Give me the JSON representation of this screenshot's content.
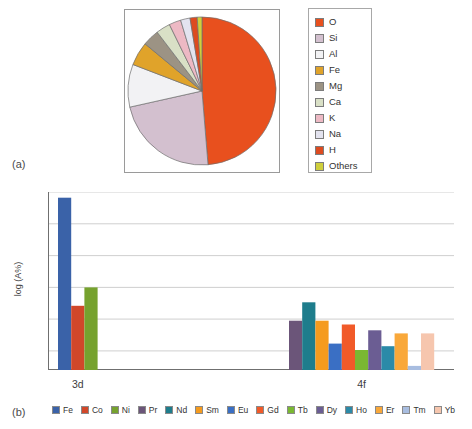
{
  "panels": {
    "a_label": "(a)",
    "b_label": "(b)"
  },
  "chart_data": [
    {
      "type": "pie",
      "title": "",
      "panel": "(a)",
      "legend_position": "right",
      "categories": [
        "O",
        "Si",
        "Al",
        "Fe",
        "Mg",
        "Ca",
        "K",
        "Na",
        "H",
        "Others"
      ],
      "values": [
        47.0,
        22.0,
        9.0,
        5.0,
        3.5,
        3.0,
        2.5,
        2.0,
        1.5,
        1.0
      ],
      "unit": "%",
      "colors": [
        "#e8501e",
        "#d3c0cf",
        "#f2f2f4",
        "#e0a32a",
        "#9c9384",
        "#d9e0c6",
        "#edb9c4",
        "#e3e3ef",
        "#dd4b20",
        "#cfcf3c"
      ],
      "legend": [
        {
          "label": "O",
          "color": "#e8501e"
        },
        {
          "label": "Si",
          "color": "#d3c0cf"
        },
        {
          "label": "Al",
          "color": "#f2f2f4"
        },
        {
          "label": "Fe",
          "color": "#e0a32a"
        },
        {
          "label": "Mg",
          "color": "#9c9384"
        },
        {
          "label": "Ca",
          "color": "#d9e0c6"
        },
        {
          "label": "K",
          "color": "#edb9c4"
        },
        {
          "label": "Na",
          "color": "#e3e3ef"
        },
        {
          "label": "H",
          "color": "#dd4b20"
        },
        {
          "label": "Others",
          "color": "#cfcf3c"
        }
      ]
    },
    {
      "type": "bar",
      "panel": "(b)",
      "title": "",
      "xlabel": "",
      "ylabel": "log (A%)",
      "ylim": [
        -4.6,
        1.0
      ],
      "yticks": [
        1,
        0,
        -1,
        -2,
        -3,
        -4
      ],
      "ytick_labels": [
        "1",
        "0",
        "−1",
        "−2",
        "−3",
        "−4"
      ],
      "grid": true,
      "legend_position": "bottom",
      "groups": [
        {
          "name": "3d",
          "label": "3d"
        },
        {
          "name": "4f",
          "label": "4f"
        }
      ],
      "categories": [
        "Fe",
        "Co",
        "Ni",
        "Pr",
        "Nd",
        "Sm",
        "Eu",
        "Gd",
        "Tb",
        "Dy",
        "Ho",
        "Er",
        "Tm",
        "Yb"
      ],
      "values": [
        0.82,
        -2.58,
        -2.0,
        -3.05,
        -2.47,
        -3.05,
        -3.77,
        -3.17,
        -3.97,
        -3.35,
        -3.85,
        -3.45,
        -4.47,
        -3.45
      ],
      "groups_of_category": [
        "3d",
        "3d",
        "3d",
        "4f",
        "4f",
        "4f",
        "4f",
        "4f",
        "4f",
        "4f",
        "4f",
        "4f",
        "4f",
        "4f"
      ],
      "colors": [
        "#3a62a8",
        "#d1472a",
        "#76a22e",
        "#6b5579",
        "#1e7d8c",
        "#f59b1e",
        "#3a6fc4",
        "#f15a29",
        "#7ab832",
        "#6b5d93",
        "#2b8aa8",
        "#f9a83a",
        "#a8bde0",
        "#f6c6ae"
      ],
      "legend": [
        {
          "label": "Fe",
          "color": "#3a62a8"
        },
        {
          "label": "Co",
          "color": "#d1472a"
        },
        {
          "label": "Ni",
          "color": "#76a22e"
        },
        {
          "label": "Pr",
          "color": "#6b5579"
        },
        {
          "label": "Nd",
          "color": "#1e7d8c"
        },
        {
          "label": "Sm",
          "color": "#f59b1e"
        },
        {
          "label": "Eu",
          "color": "#3a6fc4"
        },
        {
          "label": "Gd",
          "color": "#f15a29"
        },
        {
          "label": "Tb",
          "color": "#7ab832"
        },
        {
          "label": "Dy",
          "color": "#6b5d93"
        },
        {
          "label": "Ho",
          "color": "#2b8aa8"
        },
        {
          "label": "Er",
          "color": "#f9a83a"
        },
        {
          "label": "Tm",
          "color": "#a8bde0"
        },
        {
          "label": "Yb",
          "color": "#f6c6ae"
        }
      ]
    }
  ]
}
